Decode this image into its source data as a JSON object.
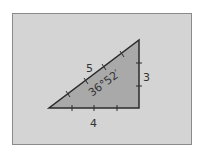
{
  "diagram": {
    "type": "right-triangle",
    "hypotenuse_label": "5",
    "vertical_leg_label": "3",
    "horizontal_leg_label": "4",
    "angle_label": "36°52′",
    "colors": {
      "background": "#d4d4d4",
      "triangle_fill": "#a9a9a9",
      "stroke": "#2b2b2b",
      "frame_border": "#8a8a8a"
    }
  }
}
